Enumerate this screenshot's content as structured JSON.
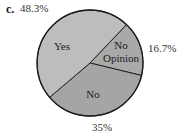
{
  "part_label": "c.",
  "chart_data": {
    "type": "pie",
    "title": "",
    "categories": [
      "Yes",
      "No Opinion",
      "No"
    ],
    "values": [
      48.3,
      16.7,
      35
    ],
    "value_labels": [
      "48.3%",
      "16.7%",
      "35%"
    ],
    "colors": [
      "#bdbdbd",
      "#a9a9a9",
      "#a5a5a5"
    ],
    "slice_text": {
      "yes": "Yes",
      "no_opinion_line1": "No",
      "no_opinion_line2": "Opinion",
      "no": "No"
    },
    "legend": "none",
    "label_position": "outside"
  }
}
